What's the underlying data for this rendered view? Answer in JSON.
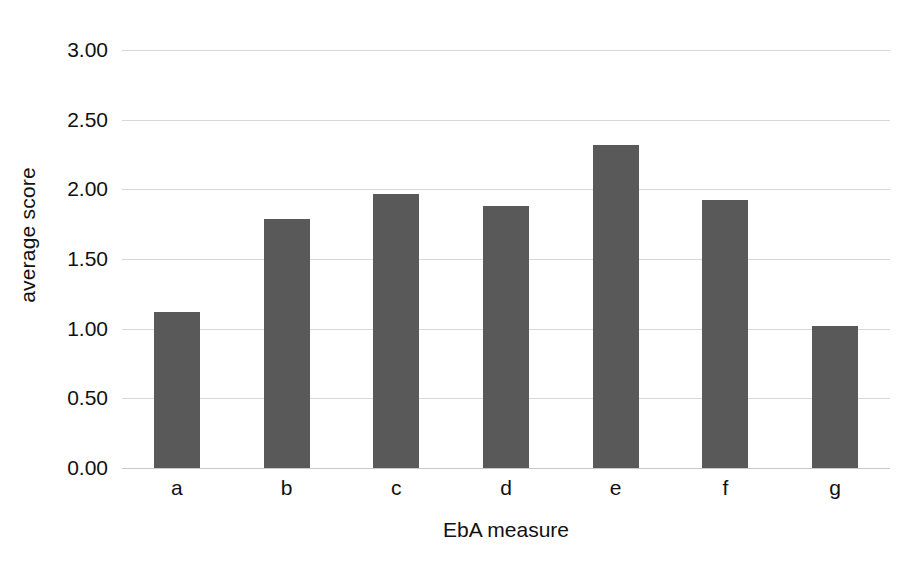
{
  "chart_data": {
    "type": "bar",
    "title": "",
    "subtitle": "",
    "xlabel": "EbA measure",
    "ylabel": "average score",
    "categories": [
      "a",
      "b",
      "c",
      "d",
      "e",
      "f",
      "g"
    ],
    "values": [
      1.12,
      1.79,
      1.97,
      1.88,
      2.32,
      1.92,
      1.02
    ],
    "series": [
      {
        "name": "average score",
        "values": [
          1.12,
          1.79,
          1.97,
          1.88,
          2.32,
          1.92,
          1.02
        ]
      }
    ],
    "ylim": [
      0.0,
      3.0
    ],
    "ytick_values": [
      0.0,
      0.5,
      1.0,
      1.5,
      2.0,
      2.5,
      3.0
    ],
    "ytick_labels": [
      "0.00",
      "0.50",
      "1.00",
      "1.50",
      "2.00",
      "2.50",
      "3.00"
    ],
    "grid": true,
    "grid_axis": "y",
    "legend": false,
    "legend_position": "none",
    "bar_color": "#595959",
    "gridline_color": "#d8d8d8",
    "background_color": "#ffffff",
    "text_color": "#111111",
    "annotations": []
  }
}
